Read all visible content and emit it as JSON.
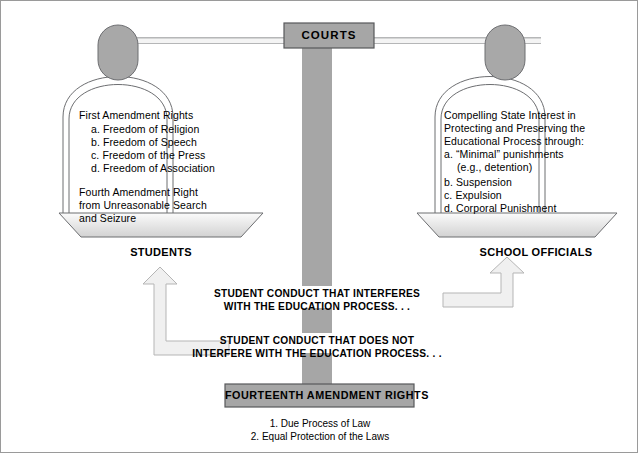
{
  "diagram": {
    "title_box": {
      "label": "COURTS"
    },
    "left_pan": {
      "heading": "First Amendment Rights",
      "items": [
        "a. Freedom of Religion",
        "b. Freedom of Speech",
        "c. Freedom of the Press",
        "d. Freedom of Association"
      ],
      "second_heading_line1": "Fourth Amendment Right",
      "second_heading_line2": "from Unreasonable Search",
      "second_heading_line3": "and Seizure",
      "pan_label": "STUDENTS"
    },
    "right_pan": {
      "heading_line1": "Compelling State Interest in",
      "heading_line2": "Protecting and Preserving the",
      "heading_line3": "Educational Process through:",
      "items": [
        "a. “Minimal” punishments",
        "(e.g., detention)",
        "b. Suspension",
        "c. Expulsion",
        "d. Corporal Punishment"
      ],
      "pan_label": "SCHOOL OFFICIALS"
    },
    "captions": {
      "interferes_line1": "STUDENT CONDUCT THAT INTERFERES",
      "interferes_line2": "WITH THE EDUCATION PROCESS. . .",
      "not_interfere_line1": "STUDENT CONDUCT THAT DOES NOT",
      "not_interfere_line2": "INTERFERE WITH THE EDUCATION PROCESS. . ."
    },
    "bottom_box": {
      "label": "FOURTEENTH AMENDMENT RIGHTS",
      "footer_items": [
        "1. Due Process of Law",
        "2. Equal Protection of the Laws"
      ]
    },
    "colors": {
      "box_fill": "#a6a6a6",
      "column_fill": "#a6a6a6",
      "hanger_fill": "#a8a8a8",
      "pan_fill_light": "#f2f2f2",
      "pan_fill_dark": "#d9d9d9",
      "arrow_fill": "#f0f0f0",
      "stroke": "#58595b",
      "frame": "#9a9a9a",
      "text": "#000000"
    }
  }
}
